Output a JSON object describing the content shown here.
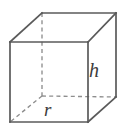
{
  "figure": {
    "shape_name": "rectangular-prism",
    "background_color": "#ffffff",
    "visible_edge_color": "#5a5a5a",
    "hidden_edge_color": "#8e8e8e",
    "label_color": "#3c3c3c"
  },
  "labels": {
    "height": "h",
    "radius": "r"
  },
  "geometry": {
    "front_face": {
      "top_left": [
        10,
        42
      ],
      "top_right": [
        88,
        42
      ],
      "bottom_right": [
        88,
        122
      ],
      "bottom_left": [
        10,
        122
      ]
    },
    "back_face": {
      "top_left": [
        42,
        13
      ],
      "top_right": [
        116,
        13
      ],
      "bottom_right": [
        116,
        97
      ],
      "bottom_left": [
        42,
        96
      ]
    },
    "visible_edges": [
      "front-top",
      "front-right",
      "front-bottom",
      "front-left",
      "back-top",
      "back-right",
      "top-left-connector",
      "top-right-connector",
      "bottom-right-connector"
    ],
    "hidden_edges": [
      "back-left-vertical",
      "back-bottom",
      "bottom-left-connector"
    ]
  }
}
